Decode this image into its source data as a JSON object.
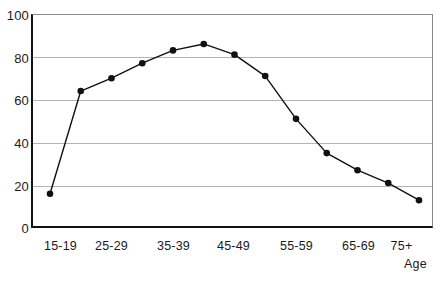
{
  "chart_data": {
    "type": "line",
    "title": "",
    "subtitle": "",
    "xlabel": "Age",
    "ylabel": "",
    "categories": [
      "15-19",
      "20-24",
      "25-29",
      "30-34",
      "35-39",
      "40-44",
      "45-49",
      "50-54",
      "55-59",
      "60-64",
      "65-69",
      "70-74",
      "75+"
    ],
    "tick_labels": [
      "15-19",
      "25-29",
      "35-39",
      "45-49",
      "55-59",
      "65-69",
      "75+"
    ],
    "values": [
      16,
      64,
      70,
      77,
      83,
      86,
      81,
      71,
      51,
      35,
      27,
      21,
      13
    ],
    "ylim": [
      0,
      100
    ],
    "yticks": [
      0,
      20,
      40,
      60,
      80,
      100
    ],
    "ytick_labels": [
      "0",
      "20",
      "40",
      "60",
      "80",
      "100"
    ],
    "grid": true,
    "grid_axis": "y",
    "legend": "none",
    "marker": "filled-circle",
    "line_color": "#111111",
    "marker_color": "#111111",
    "grid_color": "#b4b4b4",
    "axis_color": "#111111"
  },
  "axis": {
    "y_labels": [
      {
        "text": "100",
        "value": 100
      },
      {
        "text": "80",
        "value": 80
      },
      {
        "text": "60",
        "value": 60
      },
      {
        "text": "40",
        "value": 40
      },
      {
        "text": "20",
        "value": 20
      },
      {
        "text": "0",
        "value": 0
      }
    ],
    "x_labels": [
      {
        "text": "15-19",
        "center": 60
      },
      {
        "text": "25-29",
        "center": 111
      },
      {
        "text": "35-39",
        "center": 173
      },
      {
        "text": "45-49",
        "center": 233
      },
      {
        "text": "55-59",
        "center": 296
      },
      {
        "text": "65-69",
        "center": 358
      },
      {
        "text": "75+",
        "center": 401
      }
    ],
    "x_title": "Age"
  }
}
